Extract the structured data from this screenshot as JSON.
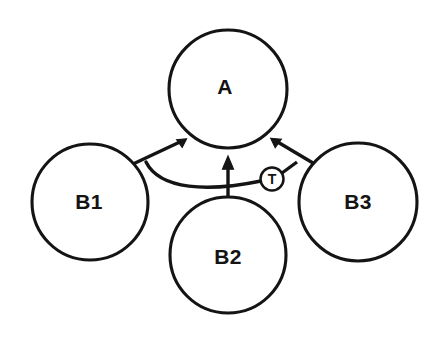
{
  "diagram": {
    "background_color": "#ffffff",
    "stroke_color": "#141414",
    "nodes": [
      {
        "id": "A",
        "label": "A",
        "cx": 228,
        "cy": 89,
        "r": 59,
        "label_x": 225,
        "label_y": 88
      },
      {
        "id": "B1",
        "label": "B1",
        "cx": 90,
        "cy": 202,
        "r": 58,
        "label_x": 89,
        "label_y": 203
      },
      {
        "id": "B2",
        "label": "B2",
        "cx": 228,
        "cy": 255,
        "r": 58,
        "label_x": 228,
        "label_y": 258
      },
      {
        "id": "B3",
        "label": "B3",
        "cx": 358,
        "cy": 202,
        "r": 59,
        "label_x": 358,
        "label_y": 203
      }
    ],
    "modifiers": [
      {
        "id": "T",
        "label": "T",
        "cx": 272,
        "cy": 179,
        "r": 11.5,
        "label_x": 272,
        "label_y": 180
      }
    ],
    "edges": [
      {
        "id": "b1-to-a",
        "from": "B1",
        "to": "A",
        "kind": "arrow",
        "path": "M 133 164 L 182 141",
        "arrow_points": "186.6 138.8 176.6 139.6 182.2 147.5"
      },
      {
        "id": "b2-to-a",
        "from": "B2",
        "to": "A",
        "kind": "arrow",
        "path": "M 228 198 L 228 164",
        "arrow_points": "228 156 222.4 169.2 233.6 169.2"
      },
      {
        "id": "b3-to-a",
        "from": "B3",
        "to": "A",
        "kind": "arrow",
        "path": "M 318 166 L 276 141",
        "arrow_points": "270.6 138.2 281.4 139.2 275.2 147.8"
      },
      {
        "id": "b1-inhibits-b3-edge",
        "from": "B1",
        "to": "T",
        "kind": "arc",
        "path": "M 146 162 C 160 190 208 192 261 181"
      },
      {
        "id": "t-to-b3-junction",
        "from": "T",
        "to": "b3-to-a",
        "kind": "line",
        "path": "M 282 173 L 297 162"
      }
    ]
  }
}
